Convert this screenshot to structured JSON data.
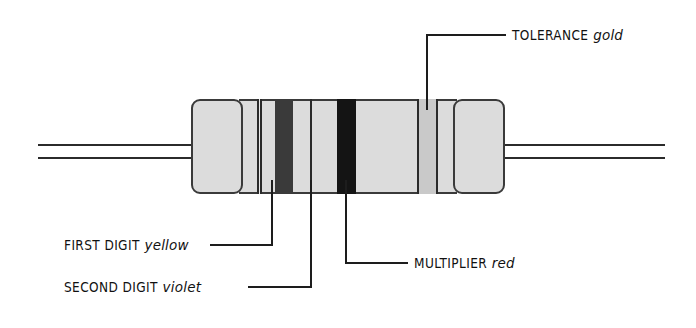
{
  "diagram": {
    "background_color": "#ffffff",
    "body": {
      "fill_color": "#dcdcdc",
      "outline_color": "#3a3a3a",
      "lead_color": "#2b2b2b"
    },
    "bands": [
      {
        "name": "first-digit-band",
        "color_name": "yellow",
        "fill_color": "#e8e8e8",
        "edge_color": "#2a2a2a",
        "x": 258,
        "width": 4
      },
      {
        "name": "second-digit-band",
        "color_name": "violet",
        "fill_color": "#3a3a3a",
        "edge_color": "#2a2a2a",
        "x": 275,
        "width": 18
      },
      {
        "name": "multiplier-band",
        "color_name": "red",
        "fill_color": "#141414",
        "edge_color": "#141414",
        "x": 337,
        "width": 19
      },
      {
        "name": "tolerance-band",
        "color_name": "gold",
        "fill_color": "#c9c9c9",
        "edge_color": "#2a2a2a",
        "x": 417,
        "width": 21
      }
    ],
    "callouts": [
      {
        "name": "tolerance",
        "category": "TOLERANCE",
        "color_word": "gold",
        "text": "TOLERANCE gold"
      },
      {
        "name": "first-digit",
        "category": "FIRST DIGIT",
        "color_word": "yellow",
        "text": "FIRST DIGIT yellow"
      },
      {
        "name": "second-digit",
        "category": "SECOND DIGIT",
        "color_word": "violet",
        "text": "SECOND DIGIT violet"
      },
      {
        "name": "multiplier",
        "category": "MULTIPLIER",
        "color_word": "red",
        "text": "MULTIPLIER red"
      }
    ]
  }
}
